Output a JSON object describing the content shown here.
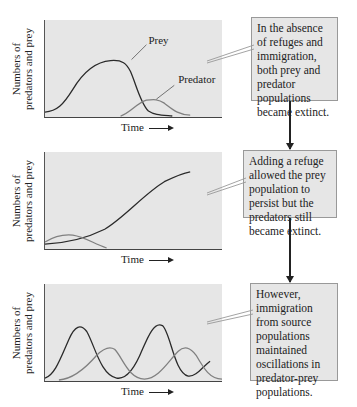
{
  "panels": [
    {
      "ylabel_line1": "Numbers of",
      "ylabel_line2": "predators and prey",
      "xlabel": "Time",
      "curve_labels": {
        "prey": "Prey",
        "predator": "Predator"
      },
      "note": "In the absence of refuges and immigration, both prey and predator populations became extinct."
    },
    {
      "ylabel_line1": "Numbers of",
      "ylabel_line2": "predators and prey",
      "xlabel": "Time",
      "note": "Adding a refuge allowed the prey population to persist but the predators still became extinct."
    },
    {
      "ylabel_line1": "Numbers of",
      "ylabel_line2": "predators and prey",
      "xlabel": "Time",
      "note": "However, immigration from source populations maintained oscillations in predator-prey populations."
    }
  ],
  "colors": {
    "panel_bg": "#e6e6e6",
    "prey_line": "#2a2a2a",
    "predator_line": "#808080",
    "note_border": "#999999"
  }
}
